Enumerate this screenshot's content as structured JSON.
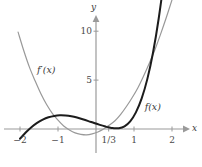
{
  "chart_data": {
    "type": "line",
    "title": "",
    "xlabel": "x",
    "ylabel": "y",
    "xlim": [
      -2.15,
      2.35
    ],
    "ylim": [
      -3.2,
      12.2
    ],
    "grid": false,
    "legend": "inline-curve-labels",
    "axis_color": "#9a9a9a",
    "x_ticks": [
      {
        "value": -2,
        "label": "−2"
      },
      {
        "value": -1,
        "label": "−1"
      },
      {
        "value": 0.3333,
        "label": "1/3"
      },
      {
        "value": 1,
        "label": "1"
      },
      {
        "value": 2,
        "label": "2"
      }
    ],
    "y_ticks": [
      {
        "value": 5,
        "label": "5"
      },
      {
        "value": 10,
        "label": "10"
      }
    ],
    "series": [
      {
        "name": "f(x)",
        "label": "f(x)",
        "color": "#1c1c1c",
        "width": 2.0,
        "expression": "x^3 + x^2 - x + 1 (approx.)",
        "x": [
          -2.0,
          -1.85,
          -1.7,
          -1.55,
          -1.4,
          -1.25,
          -1.1,
          -0.95,
          -0.8,
          -0.65,
          -0.5,
          -0.35,
          -0.2,
          -0.05,
          0.1,
          0.25,
          0.3333,
          0.45,
          0.6,
          0.75,
          0.9,
          1.05,
          1.2,
          1.35,
          1.5,
          1.65,
          1.8,
          1.95,
          2.1
        ],
        "y": [
          -1.0,
          -0.36,
          0.18,
          0.62,
          0.96,
          1.2,
          1.34,
          1.4,
          1.38,
          1.3,
          1.17,
          1.0,
          0.81,
          0.61,
          0.42,
          0.25,
          0.17,
          0.09,
          0.08,
          0.27,
          0.78,
          1.7,
          3.1,
          5.1,
          7.8,
          11.3,
          15.7,
          21.2,
          27.8
        ]
      },
      {
        "name": "f'(x)",
        "label": "f′(x)",
        "color": "#999999",
        "width": 1.2,
        "expression": "3x^2 + 2x - 1 (approx.)",
        "x": [
          -2.05,
          -1.9,
          -1.75,
          -1.6,
          -1.45,
          -1.3,
          -1.15,
          -1.0,
          -0.85,
          -0.7,
          -0.55,
          -0.4,
          -0.25,
          -0.1,
          0.05,
          0.2,
          0.3333,
          0.5,
          0.65,
          0.8,
          0.95,
          1.1,
          1.25,
          1.4,
          1.55,
          1.7,
          1.85,
          2.0
        ],
        "y": [
          9.9,
          8.0,
          6.3,
          4.9,
          3.6,
          2.5,
          1.6,
          0.9,
          0.3,
          -0.1,
          -0.4,
          -0.55,
          -0.6,
          -0.5,
          -0.3,
          0.0,
          0.35,
          0.85,
          1.5,
          2.3,
          3.2,
          4.2,
          5.4,
          6.7,
          8.1,
          9.7,
          11.4,
          13.2
        ]
      }
    ],
    "curve_labels": [
      {
        "text": "f′(x)",
        "x": -1.55,
        "y": 6.0,
        "color": "#3a3a3a"
      },
      {
        "text": "f(x)",
        "x": 1.28,
        "y": 2.3,
        "color": "#3a3a3a"
      }
    ]
  },
  "axes": {
    "x_axis_label": "x",
    "y_axis_label": "y"
  }
}
